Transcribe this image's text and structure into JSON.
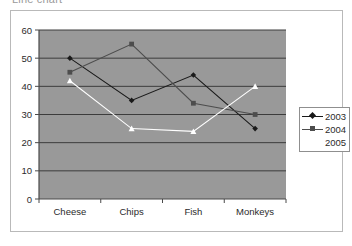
{
  "title": "Line chart",
  "legend": {
    "position": "right",
    "entries": [
      {
        "label": "2003",
        "color": "#1a1a1a",
        "marker": "diamond"
      },
      {
        "label": "2004",
        "color": "#4d4d4d",
        "marker": "square"
      },
      {
        "label": "2005",
        "color": "#ffffff",
        "marker": "triangle"
      }
    ]
  },
  "axes": {
    "y_ticks": [
      "0",
      "10",
      "20",
      "30",
      "40",
      "50",
      "60"
    ],
    "x_ticks": [
      "Cheese",
      "Chips",
      "Fish",
      "Monkeys"
    ]
  },
  "style": {
    "plot_background": "#999999",
    "gridline_color": "#3c3c3c",
    "axis_color": "#4a4a4a",
    "frame_color": "#b9b9b9",
    "page_background": "#ffffff",
    "tick_label_color": "#2b2b2b"
  },
  "chart_data": {
    "type": "line",
    "title": "Line chart",
    "xlabel": "",
    "ylabel": "",
    "ylim": [
      0,
      60
    ],
    "ytick_step": 10,
    "grid": true,
    "legend_position": "right",
    "categories": [
      "Cheese",
      "Chips",
      "Fish",
      "Monkeys"
    ],
    "series": [
      {
        "name": "2003",
        "color": "#1a1a1a",
        "marker": "diamond",
        "values": [
          50,
          35,
          44,
          25
        ]
      },
      {
        "name": "2004",
        "color": "#4d4d4d",
        "marker": "square",
        "values": [
          45,
          55,
          34,
          30
        ]
      },
      {
        "name": "2005",
        "color": "#ffffff",
        "marker": "triangle",
        "values": [
          42,
          25,
          24,
          40
        ]
      }
    ]
  }
}
